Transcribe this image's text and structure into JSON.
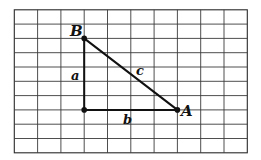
{
  "diagram": {
    "type": "right-triangle-on-grid",
    "grid": {
      "columns": 10,
      "rows": 10,
      "origin_px": [
        14.3,
        9.8
      ],
      "cell_w_px": 23.3,
      "cell_h_px": 14.3,
      "line_color": "#3a3a3a"
    },
    "vertices": [
      {
        "id": "B",
        "label": "B",
        "grid": [
          3,
          2
        ]
      },
      {
        "id": "C",
        "label": "",
        "grid": [
          3,
          7
        ]
      },
      {
        "id": "A",
        "label": "A",
        "grid": [
          7,
          7
        ]
      }
    ],
    "sides": [
      {
        "id": "a",
        "label": "a",
        "from": "B",
        "to": "C"
      },
      {
        "id": "b",
        "label": "b",
        "from": "C",
        "to": "A"
      },
      {
        "id": "c",
        "label": "c",
        "from": "B",
        "to": "A"
      }
    ],
    "labels": {
      "B": "B",
      "A": "A",
      "a": "a",
      "b": "b",
      "c": "c"
    }
  }
}
